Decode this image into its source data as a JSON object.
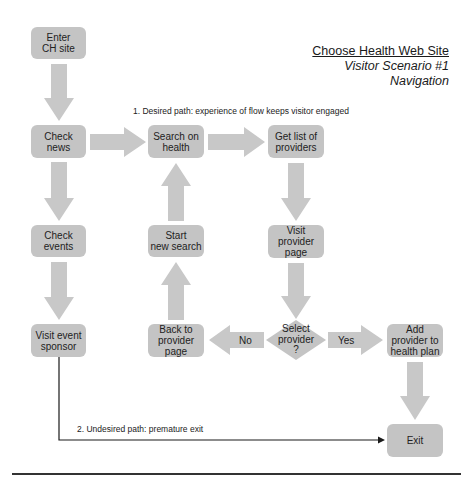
{
  "header": {
    "title": "Choose Health Web Site",
    "subtitle": "Visitor Scenario #1",
    "section": "Navigation"
  },
  "paths": {
    "desired": "1. Desired path: experience of flow keeps visitor engaged",
    "undesired": "2. Undesired path: premature exit"
  },
  "nodes": {
    "enter": "Enter\nCH site",
    "check_news": "Check\nnews",
    "check_events": "Check\nevents",
    "visit_sponsor": "Visit event\nsponsor",
    "search_health": "Search on\nhealth",
    "start_new_search": "Start\nnew search",
    "back_to_provider": "Back to\nprovider\npage",
    "get_list": "Get list of\nproviders",
    "visit_provider": "Visit\nprovider\npage",
    "select_provider": "Select\nprovider\n?",
    "add_provider": "Add\nprovider to\nhealth plan",
    "exit": "Exit"
  },
  "edges": {
    "no_label": "No",
    "yes_label": "Yes"
  },
  "colors": {
    "node_fill": "#c4c4c4",
    "arrow_fill": "#c8c8c8",
    "line": "#1a1a1a"
  }
}
